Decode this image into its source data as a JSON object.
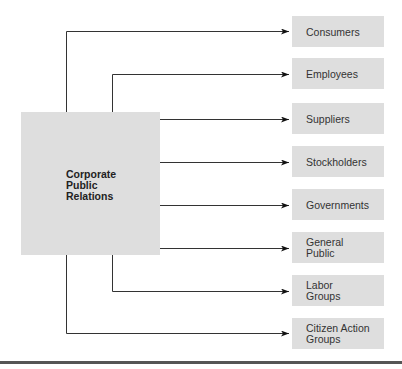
{
  "diagram": {
    "source": {
      "label": "Corporate\nPublic\nRelations"
    },
    "targets": [
      {
        "label": "Consumers",
        "top": 16
      },
      {
        "label": "Employees",
        "top": 58
      },
      {
        "label": "Suppliers",
        "top": 103
      },
      {
        "label": "Stockholders",
        "top": 146
      },
      {
        "label": "Governments",
        "top": 189
      },
      {
        "label": "General\nPublic",
        "top": 232
      },
      {
        "label": "Labor\nGroups",
        "top": 275
      },
      {
        "label": "Citizen Action\nGroups",
        "top": 318
      }
    ]
  }
}
